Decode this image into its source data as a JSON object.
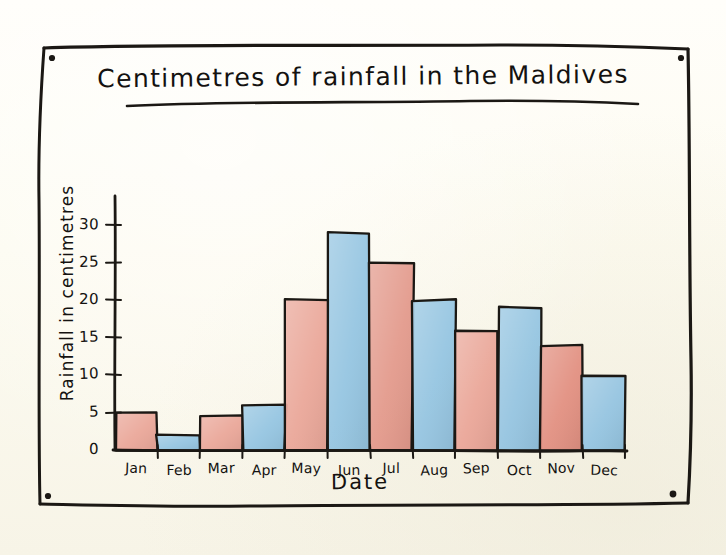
{
  "page": {
    "background_color": "#fefdf6",
    "frame_color": "#1b1814",
    "corner_marks": 4
  },
  "chart_data": {
    "type": "bar",
    "title": "Centimetres of rainfall in the Maldives",
    "xlabel": "Date",
    "ylabel": "Rainfall in centimetres",
    "categories": [
      "Jan",
      "Feb",
      "Mar",
      "Apr",
      "May",
      "Jun",
      "Jul",
      "Aug",
      "Sep",
      "Oct",
      "Nov",
      "Dec"
    ],
    "values": [
      5,
      2,
      4.5,
      6,
      20,
      29,
      25,
      20,
      16,
      19,
      14,
      10
    ],
    "bar_colors": [
      "#e8a091",
      "#8cc0e0",
      "#e8a091",
      "#8cc0e0",
      "#e8a091",
      "#8cc0e0",
      "#e19183",
      "#8cc0e0",
      "#e8a091",
      "#8cc0e0",
      "#e08878",
      "#8cc0e0"
    ],
    "ylim": [
      0,
      32
    ],
    "yticks": [
      0,
      5,
      10,
      15,
      20,
      25,
      30
    ],
    "ytick_labels": [
      "0",
      "5",
      "10",
      "15",
      "20",
      "25",
      "30"
    ],
    "grid": false,
    "legend": "none",
    "style": "hand-drawn watercolour sketch"
  },
  "colors": {
    "red": "#e8a091",
    "red_deep": "#e08878",
    "blue": "#8cc0e0",
    "ink": "#1b1814",
    "paper": "#fefdf6"
  }
}
